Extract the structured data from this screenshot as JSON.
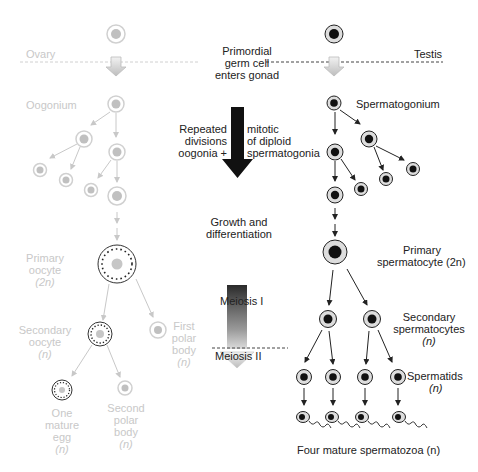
{
  "colors": {
    "female_faint": "#c8c8c8",
    "male_dark": "#1a1a1a",
    "cell_ring_female": "#d0d0d0",
    "nucleus_female": "#bdbdbd",
    "nucleus_male": "#111111",
    "cell_fill_male": "#d9d9d9"
  },
  "regions": {
    "ovary_label": "Ovary",
    "testis_label": "Testis"
  },
  "center": {
    "primordial": [
      "Primordial",
      "germ cell",
      "enters gonad"
    ],
    "mitosis_left": [
      "Repeated",
      "divisions",
      "oogonia +"
    ],
    "mitosis_right": [
      "mitotic",
      "of diploid",
      "spermatogonia"
    ],
    "growth": [
      "Growth and",
      "differentiation"
    ],
    "meiosis1": "Meiosis I",
    "meiosis2": "Meiosis II"
  },
  "female": {
    "oogonium": "Oogonium",
    "primary_oocyte": [
      "Primary",
      "oocyte",
      "(2n)"
    ],
    "secondary_oocyte": [
      "Secondary",
      "oocyte",
      "(n)"
    ],
    "first_polar_body": [
      "First",
      "polar",
      "body",
      "(n)"
    ],
    "mature_egg": [
      "One",
      "mature",
      "egg",
      "(n)"
    ],
    "second_polar_body": [
      "Second",
      "polar",
      "body",
      "(n)"
    ]
  },
  "male": {
    "spermatogonium": "Spermatogonium",
    "primary_spermatocyte": [
      "Primary",
      "spermatocyte (2n)"
    ],
    "secondary_spermatocytes": [
      "Secondary",
      "spermatocytes",
      "(n)"
    ],
    "spermatids": [
      "Spermatids",
      "(n)"
    ],
    "spermatozoa": "Four mature spermatozoa (n)"
  }
}
